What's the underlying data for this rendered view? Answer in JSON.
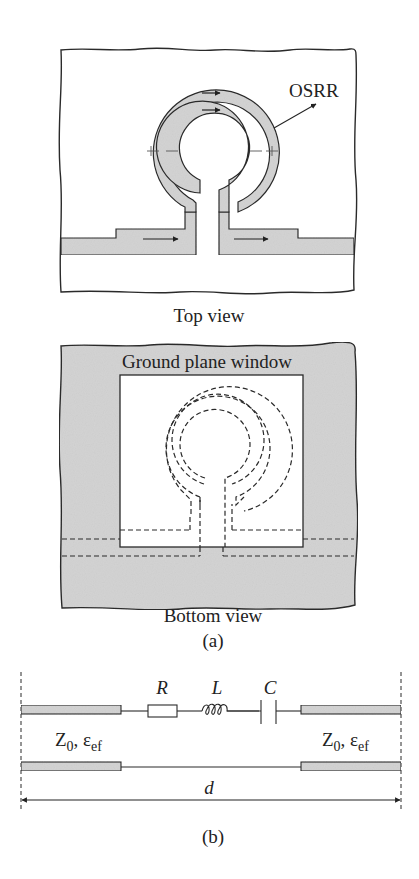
{
  "figure": {
    "panel_a": {
      "top_view": {
        "label_osrr": "OSRR",
        "caption": "Top view"
      },
      "bottom_view": {
        "label_window": "Ground plane window",
        "caption": "Bottom view"
      },
      "panel_label": "(a)"
    },
    "panel_b": {
      "components": {
        "resistor": "R",
        "inductor": "L",
        "capacitor": "C"
      },
      "line_left": {
        "z": "Z",
        "z_sub": "0",
        "eps": ", ε",
        "eps_sub": "ef"
      },
      "line_right": {
        "z": "Z",
        "z_sub": "0",
        "eps": ", ε",
        "eps_sub": "ef"
      },
      "length_label": "d",
      "panel_label": "(b)"
    },
    "colors": {
      "metal_fill": "#d4d4d4",
      "stroke": "#2a2a2a",
      "background": "#ffffff"
    }
  }
}
